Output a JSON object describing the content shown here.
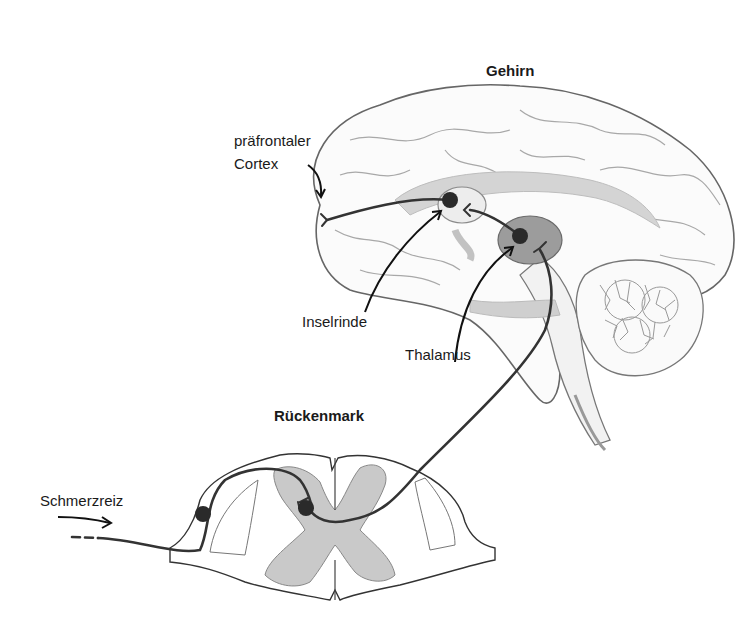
{
  "diagram": {
    "type": "pain pathway illustration",
    "labels": {
      "brain": "Gehirn",
      "prefrontal_line1": "präfrontaler",
      "prefrontal_line2": "Cortex",
      "insula": "Inselrinde",
      "thalamus": "Thalamus",
      "spinal_cord": "Rückenmark",
      "stimulus": "Schmerzreiz"
    },
    "colors": {
      "outline": "#555555",
      "nerve_path": "#333333",
      "neuron_body": "#2a2a2a",
      "gray_matter": "#c8c8c8",
      "thalamus_fill": "#9a9a9a",
      "brain_structures": "#cfcfcf",
      "background": "#ffffff"
    }
  }
}
